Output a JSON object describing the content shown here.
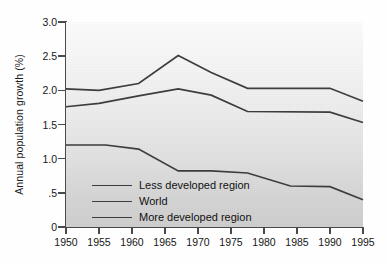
{
  "chart_data": {
    "type": "line",
    "title": "",
    "xlabel": "",
    "ylabel": "Annual population growth (%)",
    "grid": false,
    "legend_position": "inside-lower-left",
    "xlim": [
      1950,
      1995
    ],
    "ylim": [
      0,
      3.0
    ],
    "xticks": [
      "1950",
      "1955",
      "1960",
      "1965",
      "1970",
      "1975",
      "1980",
      "1985",
      "1990",
      "1995"
    ],
    "xtick_values": [
      1950,
      1955,
      1960,
      1965,
      1970,
      1975,
      1980,
      1985,
      1990,
      1995
    ],
    "yticks": [
      "0",
      ".5",
      "1.0",
      "1.5",
      "2.0",
      "2.5",
      "3.0"
    ],
    "ytick_values": [
      0,
      0.5,
      1.0,
      1.5,
      2.0,
      2.5,
      3.0
    ],
    "series": [
      {
        "name": "Less developed region",
        "x": [
          1950,
          1955,
          1961,
          1967,
          1972,
          1977.5,
          1990,
          1995
        ],
        "values": [
          2.02,
          2.0,
          2.1,
          2.51,
          2.26,
          2.03,
          2.03,
          1.84
        ]
      },
      {
        "name": "World",
        "x": [
          1950,
          1955,
          1961,
          1967,
          1972,
          1977.5,
          1990,
          1995
        ],
        "values": [
          1.76,
          1.81,
          1.92,
          2.02,
          1.93,
          1.69,
          1.68,
          1.53
        ]
      },
      {
        "name": "More developed region",
        "x": [
          1950,
          1956,
          1961,
          1967,
          1972,
          1977.5,
          1984,
          1990,
          1995
        ],
        "values": [
          1.2,
          1.2,
          1.14,
          0.82,
          0.82,
          0.79,
          0.6,
          0.59,
          0.4
        ]
      }
    ]
  },
  "legend": {
    "items": [
      {
        "label": "Less developed region"
      },
      {
        "label": "World"
      },
      {
        "label": "More developed region"
      }
    ]
  },
  "axes": {
    "y_title": "Annual population growth (%)",
    "y_labels": [
      "3.0",
      "2.5",
      "2.0",
      "1.5",
      "1.0",
      ".5",
      "0"
    ],
    "x_labels": [
      "1950",
      "1955",
      "1960",
      "1965",
      "1970",
      "1975",
      "1980",
      "1985",
      "1990",
      "1995"
    ]
  },
  "colors": {
    "line": "#3d3d3d",
    "axis": "#4a4a4a",
    "text": "#161616",
    "plot_bg_top": "#fdfdfd",
    "plot_bg_bottom": "#cfcfcf"
  }
}
